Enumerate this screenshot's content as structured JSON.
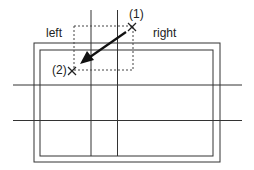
{
  "labels": {
    "left": "left",
    "right": "right",
    "p1": "(1)",
    "p2": "(2)"
  },
  "colors": {
    "line": "#222222"
  }
}
